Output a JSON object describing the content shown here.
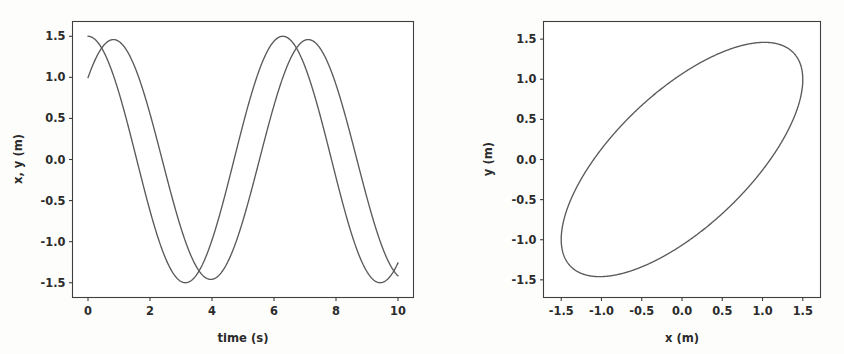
{
  "figure": {
    "background": "#fdfdfb",
    "axes_color": "#3f3f3f",
    "curve_color": "#5a5a5a",
    "width": 844,
    "height": 354
  },
  "chart_data": [
    {
      "type": "line",
      "panel": "left",
      "title": "",
      "xlabel": "time (s)",
      "ylabel": "x, y (m)",
      "xlim": [
        -0.5,
        10.5
      ],
      "ylim": [
        -1.68,
        1.68
      ],
      "xticks": [
        0,
        2,
        4,
        6,
        8,
        10
      ],
      "xticklabels": [
        "0",
        "2",
        "4",
        "6",
        "8",
        "10"
      ],
      "yticks": [
        -1.5,
        -1.0,
        -0.5,
        0.0,
        0.5,
        1.0,
        1.5
      ],
      "yticklabels": [
        "-1.5",
        "-1.0",
        "-0.5",
        "0.0",
        "0.5",
        "1.0",
        "1.5"
      ],
      "grid": false,
      "legend": "none",
      "series": [
        {
          "name": "x",
          "model": "cosine",
          "amplitude": 1.5,
          "angular_frequency": 1.0,
          "phase": 0.0,
          "t_start": 0.0,
          "t_end": 10.0,
          "y_at_t0": 1.5,
          "first_peak_t": 0.0,
          "first_peak_y": 1.5,
          "first_trough_t": 3.14,
          "first_trough_y": -1.5,
          "second_peak_t": 6.28,
          "second_peak_y": 1.5,
          "second_trough_t": 9.42,
          "second_trough_y": -1.5,
          "y_at_t10": -1.26
        },
        {
          "name": "y",
          "model": "cosine",
          "amplitude": 1.46,
          "angular_frequency": 1.0,
          "phase": -0.82,
          "t_start": 0.0,
          "t_end": 10.0,
          "y_at_t0": 1.0,
          "first_peak_t": 0.82,
          "first_peak_y": 1.46,
          "first_trough_t": 3.96,
          "first_trough_y": -1.46,
          "second_peak_t": 7.1,
          "second_peak_y": 1.46,
          "y_at_t10": -1.38
        }
      ]
    },
    {
      "type": "line",
      "panel": "right",
      "title": "",
      "xlabel": "x (m)",
      "ylabel": "y (m)",
      "xlim": [
        -1.72,
        1.72
      ],
      "ylim": [
        -1.72,
        1.72
      ],
      "xticks": [
        -1.5,
        -1.0,
        -0.5,
        0.0,
        0.5,
        1.0,
        1.5
      ],
      "xticklabels": [
        "-1.5",
        "-1.0",
        "-0.5",
        "0.0",
        "0.5",
        "1.0",
        "1.5"
      ],
      "yticks": [
        -1.5,
        -1.0,
        -0.5,
        0.0,
        0.5,
        1.0,
        1.5
      ],
      "yticklabels": [
        "-1.5",
        "-1.0",
        "-0.5",
        "0.0",
        "0.5",
        "1.0",
        "1.5"
      ],
      "grid": false,
      "legend": "none",
      "series": [
        {
          "name": "trajectory",
          "shape": "ellipse",
          "parametric_x": "1.5*cos(t)",
          "parametric_y": "1.46*cos(t - 0.82)",
          "semi_major": 2.1,
          "semi_minor": 0.54,
          "tilt_degrees": 44.5,
          "center": [
            0.0,
            0.0
          ],
          "x_extreme_max": 1.5,
          "x_extreme_min": -1.5,
          "y_extreme_max": 1.46,
          "y_extreme_min": -1.46,
          "y_at_x_max": 1.0,
          "x_at_y_max": 1.03
        }
      ]
    }
  ]
}
